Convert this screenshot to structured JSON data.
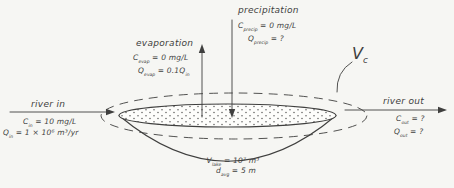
{
  "colors": {
    "ink": "#3f3f3e",
    "background": "#f6f6f3",
    "lake_surface": "#fdfdfb"
  },
  "evaporation": {
    "label": "evaporation",
    "c": [
      {
        "t": "C"
      },
      {
        "s": "evap"
      },
      {
        "t": " = 0 mg/L"
      }
    ],
    "q": [
      {
        "t": "Q"
      },
      {
        "s": "evap"
      },
      {
        "t": " = 0.1Q"
      },
      {
        "s": "in"
      }
    ]
  },
  "precipitation": {
    "label": "precipitation",
    "c": [
      {
        "t": "C"
      },
      {
        "s": "precip"
      },
      {
        "t": " = 0 mg/L"
      }
    ],
    "q": [
      {
        "t": "Q"
      },
      {
        "s": "precip"
      },
      {
        "t": " = ?"
      }
    ]
  },
  "river_in": {
    "label": "river in",
    "c": [
      {
        "t": "C"
      },
      {
        "s": "in"
      },
      {
        "t": " = 10 mg/L"
      }
    ],
    "q": [
      {
        "t": "Q"
      },
      {
        "s": "in"
      },
      {
        "t": " = 1 × 10⁶ m³/yr"
      }
    ]
  },
  "river_out": {
    "label": "river out",
    "c": [
      {
        "t": "C"
      },
      {
        "s": "out"
      },
      {
        "t": " = ?"
      }
    ],
    "q": [
      {
        "t": "Q"
      },
      {
        "s": "out"
      },
      {
        "t": " = ?"
      }
    ]
  },
  "lake": {
    "volume": [
      {
        "t": "V"
      },
      {
        "s": "lake"
      },
      {
        "t": " = 10⁷ m³"
      }
    ],
    "depth": [
      {
        "t": "d"
      },
      {
        "s": "avg"
      },
      {
        "t": " = 5 m"
      }
    ]
  },
  "control_volume": {
    "symbol": [
      {
        "t": "V"
      },
      {
        "s": "c"
      }
    ]
  }
}
